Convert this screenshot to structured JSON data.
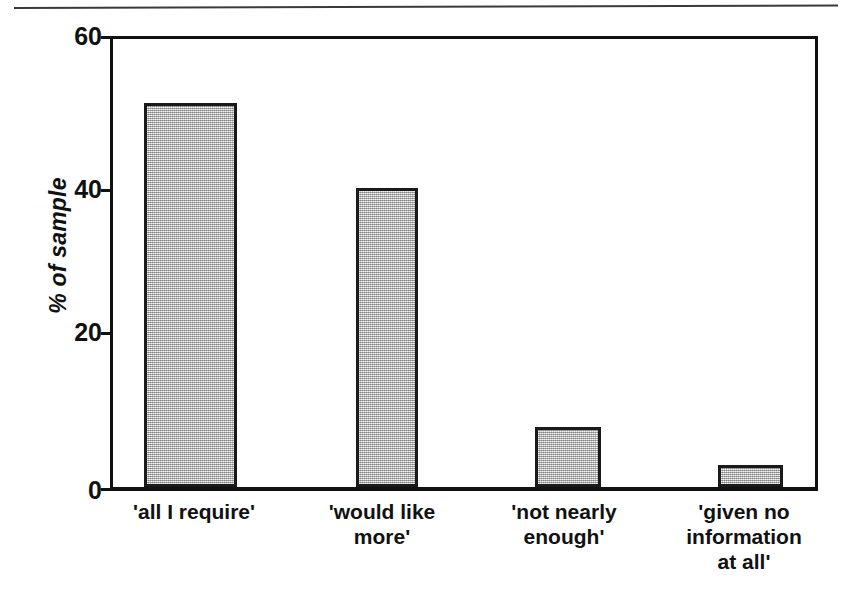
{
  "figure": {
    "top_rule": "page-separator-rule"
  },
  "chart_data": {
    "type": "bar",
    "title": "",
    "xlabel": "",
    "ylabel": "% of sample",
    "categories": [
      "'all I require'",
      "'would like more'",
      "'not nearly enough'",
      "'given no information at all'"
    ],
    "category_lines": [
      [
        "'all I require'"
      ],
      [
        "'would like",
        "more'"
      ],
      [
        "'not nearly",
        "enough'"
      ],
      [
        "'given no",
        "information",
        "at all'"
      ]
    ],
    "values": [
      51.5,
      40,
      8,
      3
    ],
    "ylim": [
      0,
      60
    ],
    "yticks": [
      0,
      20,
      40,
      60
    ],
    "ytick_labels": [
      "0",
      "20",
      "40",
      "60"
    ],
    "grid": false,
    "legend": null,
    "bar_fill_color": "#c2c2c2",
    "bar_edge_color": "#1a1a1a",
    "axis_color": "#111111",
    "background_color": "#ffffff"
  }
}
